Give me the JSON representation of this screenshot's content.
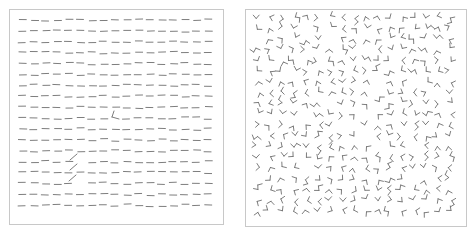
{
  "figure": {
    "background": "#ffffff",
    "border_color": "#c8c8c8",
    "stroke_color": "#6e6e6e",
    "left_panel": {
      "description": "Texture of horizontal line segments with embedded odd elements",
      "rows": 18,
      "cols": 17,
      "origin": [
        18,
        19
      ],
      "spacing": [
        11.6,
        10.9
      ],
      "element": "horizontal-dash",
      "dash_length": 7,
      "targets": [
        {
          "type": "corner",
          "x": 113,
          "y": 115,
          "label": "L-shaped corner target"
        },
        {
          "type": "diagonal",
          "x": 72,
          "y": 156
        },
        {
          "type": "diagonal",
          "x": 72,
          "y": 166
        },
        {
          "type": "diagonal",
          "x": 71,
          "y": 177
        }
      ]
    },
    "right_panel": {
      "description": "Texture of randomly oriented angle/corner elements",
      "rows": 19,
      "cols": 17,
      "origin": [
        257,
        16
      ],
      "spacing": [
        12.0,
        10.8
      ],
      "element": "random-angle",
      "seed": 7
    },
    "caption": ""
  }
}
